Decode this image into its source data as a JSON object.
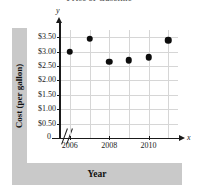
{
  "chart_data": {
    "type": "scatter",
    "title": "Price of Gasoline",
    "xlabel": "Year",
    "ylabel": "Cost (per gallon)",
    "x": [
      2006,
      2007,
      2008,
      2009,
      2010,
      2011
    ],
    "values": [
      3.0,
      3.45,
      2.65,
      2.7,
      2.8,
      3.4
    ],
    "points": [
      {
        "year": 2006,
        "cost": 3.0
      },
      {
        "year": 2007,
        "cost": 3.45
      },
      {
        "year": 2008,
        "cost": 2.65
      },
      {
        "year": 2009,
        "cost": 2.7
      },
      {
        "year": 2010,
        "cost": 2.8
      },
      {
        "year": 2011,
        "cost": 3.4
      }
    ],
    "xlim": [
      2005.5,
      2011.5
    ],
    "ylim": [
      0,
      3.75
    ],
    "xticks": [
      2006,
      2008,
      2010
    ],
    "xtick_labels": [
      "2006",
      "2008",
      "2010"
    ],
    "yticks": [
      0.5,
      1.0,
      1.5,
      2.0,
      2.5,
      3.0,
      3.5
    ],
    "ytick_labels": [
      "$0.50",
      "$1.00",
      "$1.50",
      "$2.00",
      "$2.50",
      "$3.00",
      "$3.50"
    ],
    "origin_label": "0",
    "grid": true,
    "legend": null,
    "axis_break": true,
    "x_axis_variable": "x",
    "y_axis_variable": "y",
    "marker_color": "#0d0d0d",
    "grid_color": "#d6d6d6",
    "axis_color": "#1a1a1a",
    "band_color": "#c9c9c9"
  }
}
